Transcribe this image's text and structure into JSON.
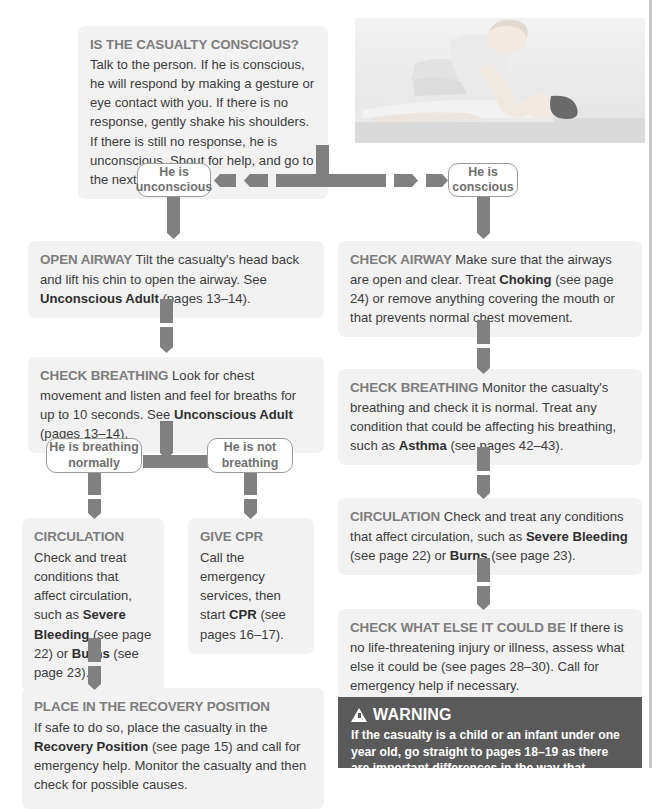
{
  "doc": {
    "title": "Unconsciousness action plan flowchart"
  },
  "photo": {
    "name": "responsiveness-check-photo",
    "alt": "Responder kneeling beside an unconscious person, shaking their shoulders"
  },
  "intro": {
    "heading": "IS THE CASUALTY CONSCIOUS?",
    "body": " Talk to the person. If he is conscious, he will respond by making a gesture or eye contact with you. If there is no response, gently shake his shoulders. If there is still no response, he is unconscious. Shout for help, and go to the next step."
  },
  "decisions": {
    "unconscious": "He is unconscious",
    "conscious": "He is conscious",
    "breathing_normally": "He is breathing normally",
    "not_breathing": "He is not breathing"
  },
  "left_column": {
    "open_airway": {
      "heading": "OPEN AIRWAY",
      "part1": " Tilt the casualty's head back and lift his chin to open the airway. See ",
      "ref1": "Unconscious Adult",
      "part2": " (pages 13–14)."
    },
    "check_breathing": {
      "heading": "CHECK BREATHING",
      "part1": " Look for chest movement and listen and feel for breaths for up to 10 seconds. See ",
      "ref1": "Unconscious Adult",
      "part2": " (pages 13–14)."
    },
    "circulation": {
      "heading": "CIRCULATION",
      "part1": "Check and treat conditions that affect circulation, such as ",
      "ref1": "Severe Bleeding",
      "part2": " (see page 22) or ",
      "ref2": "Burns",
      "part3": " (see page 23)."
    },
    "give_cpr": {
      "heading": "GIVE CPR",
      "part1": "Call the emergency services, then start ",
      "ref1": "CPR",
      "part2": " (see pages 16–17)."
    },
    "recovery": {
      "heading": "PLACE IN THE RECOVERY POSITION",
      "part1": "If safe to do so, place the casualty in the ",
      "ref1": "Recovery Position",
      "part2": " (see page 15) and call for emergency help. Monitor the casualty and then check for possible causes."
    }
  },
  "right_column": {
    "check_airway": {
      "heading": "CHECK AIRWAY",
      "part1": " Make sure that the airways are open and clear. Treat ",
      "ref1": "Choking",
      "part2": " (see page 24) or remove anything covering the mouth or that prevents normal chest movement."
    },
    "check_breathing": {
      "heading": "CHECK BREATHING",
      "part1": " Monitor the casualty's breathing and check it is normal. Treat any condition that could be affecting his breathing, such as ",
      "ref1": "Asthma",
      "part2": " (see pages 42–43)."
    },
    "circulation": {
      "heading": "CIRCULATION",
      "part1": " Check and treat any conditions that affect circulation, such as ",
      "ref1": "Severe Bleeding",
      "part2": " (see page 22) or ",
      "ref2": "Burns",
      "part3": " (see page 23)."
    },
    "check_what_else": {
      "heading": "CHECK WHAT ELSE IT COULD BE",
      "part1": " If there is no life-threatening injury or illness, assess what else it could be (see pages 28–30). Call for emergency help if necessary."
    }
  },
  "warning": {
    "icon": "warning-triangle-icon",
    "title": "WARNING",
    "body": "If the casualty is a child or an infant under one year old, go straight to pages 18–19 as there are important differences in the way that unconsciousness is managed in children."
  },
  "colors": {
    "arrow": "#808080",
    "panel_bg": "#f2f2f2",
    "heading": "#7d7d7d",
    "warning_bg": "#5a5a5a",
    "pill_border": "#9a9a9a"
  }
}
